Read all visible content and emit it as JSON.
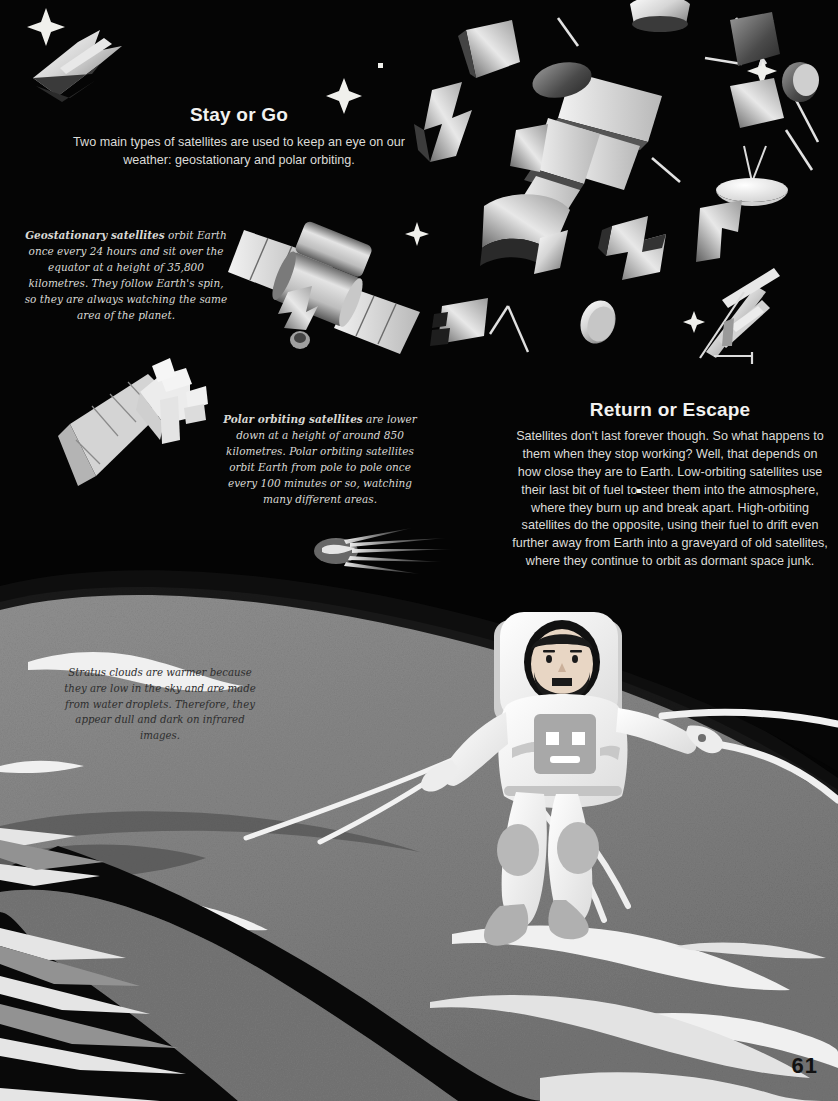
{
  "page": {
    "number": "61",
    "background_color": "#050505",
    "earth_color": "#8e8e8e",
    "cloud_color": "#ffffff",
    "text_color": "#dcdcd8",
    "heading_color": "#f2f2f0",
    "caption_dark_color": "#2e2e2e"
  },
  "sections": {
    "stay_or_go": {
      "heading": "Stay or Go",
      "body": "Two main types of satellites are used to keep an eye on our weather: geostationary and polar orbiting."
    },
    "return_or_escape": {
      "heading": "Return or Escape",
      "body": "Satellites don't last forever though. So what happens to them when they stop working? Well, that depends on how close they are to Earth. Low-orbiting satellites use their last bit of fuel to steer them into the atmosphere, where they burn up and break apart. High-orbiting satellites do the opposite, using their fuel to drift even further away from Earth into a graveyard of old satellites, where they continue to orbit as dormant space junk."
    }
  },
  "captions": {
    "geostationary": {
      "lead": "Geostationary satellites",
      "text": " orbit Earth once every 24 hours and sit over the equator at a height of 35,800 kilometres. They follow Earth's spin, so they are always watching the same area of the planet."
    },
    "polar": {
      "lead": "Polar orbiting satellites",
      "text": " are lower down at a height of around 850 kilometres. Polar orbiting satellites orbit Earth from pole to pole once every 100 minutes or so, watching many different areas."
    },
    "stratus": {
      "text": "Stratus clouds are warmer because they are low in the sky and are made from water droplets. Therefore, they appear dull and dark on infrared images."
    }
  },
  "illustration": {
    "geostationary_satellite_label": "geostationary-satellite",
    "polar_satellite_label": "polar-orbiting-satellite",
    "astronaut_label": "astronaut",
    "comet_label": "comet",
    "debris_label": "space-debris",
    "earth_label": "earth-surface"
  }
}
